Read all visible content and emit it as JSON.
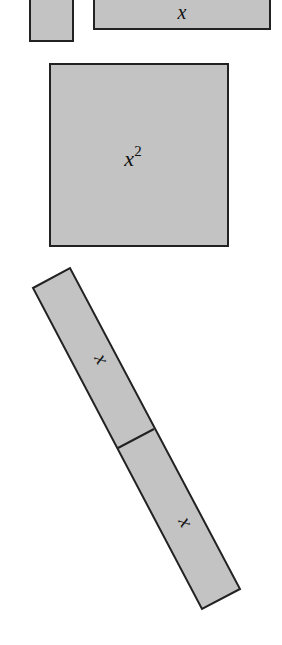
{
  "diagram": {
    "type": "algebra-tiles",
    "fill_color": "#c3c3c3",
    "stroke_color": "#222222",
    "tiles": [
      {
        "id": "unit-tile-top",
        "label": ""
      },
      {
        "id": "x-tile-top",
        "label": "x"
      },
      {
        "id": "x-squared-tile",
        "label": "x",
        "exponent": "2"
      },
      {
        "id": "x-tile-rotated-upper",
        "label": "x"
      },
      {
        "id": "x-tile-rotated-lower",
        "label": "x"
      }
    ]
  }
}
